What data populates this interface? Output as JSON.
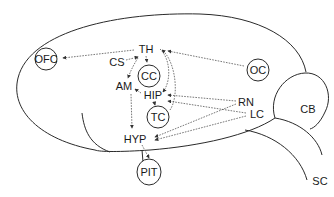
{
  "diagram": {
    "type": "brain-connectivity-schematic",
    "colors": {
      "line": "#2a2a2a",
      "arrow": "#555555",
      "background": "#ffffff"
    },
    "nodes": {
      "TH": {
        "label": "TH",
        "circled": false
      },
      "CS": {
        "label": "CS",
        "circled": false
      },
      "AM": {
        "label": "AM",
        "circled": false
      },
      "HIP": {
        "label": "HIP",
        "circled": false
      },
      "HYP": {
        "label": "HYP",
        "circled": false
      },
      "RN": {
        "label": "RN",
        "circled": false
      },
      "LC": {
        "label": "LC",
        "circled": false
      },
      "OFC": {
        "label": "OFC",
        "circled": true
      },
      "CC": {
        "label": "CC",
        "circled": true
      },
      "OC": {
        "label": "OC",
        "circled": true
      },
      "TC": {
        "label": "TC",
        "circled": true
      },
      "PIT": {
        "label": "PIT",
        "circled": true
      },
      "CB": {
        "label": "CB",
        "circled": false
      },
      "SC": {
        "label": "SC",
        "circled": false
      }
    },
    "edges": [
      {
        "from": "TH",
        "to": "OFC"
      },
      {
        "from": "OC",
        "to": "TH"
      },
      {
        "from": "CS",
        "to": "TH"
      },
      {
        "from": "TH",
        "to": "CC"
      },
      {
        "from": "TH",
        "to": "AM"
      },
      {
        "from": "TH",
        "to": "HIP"
      },
      {
        "from": "TC",
        "to": "TH"
      },
      {
        "from": "HIP",
        "to": "AM"
      },
      {
        "from": "HIP",
        "to": "TC"
      },
      {
        "from": "AM",
        "to": "HYP"
      },
      {
        "from": "RN",
        "to": "HIP"
      },
      {
        "from": "LC",
        "to": "HIP"
      },
      {
        "from": "RN",
        "to": "HYP"
      },
      {
        "from": "LC",
        "to": "HYP"
      },
      {
        "from": "HYP",
        "to": "PIT"
      }
    ]
  }
}
